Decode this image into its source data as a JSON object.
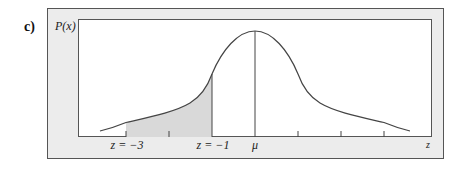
{
  "part_label": "c)",
  "figure": {
    "y_axis_label": "P(x)",
    "x_axis_label": "z",
    "tick_labels": [
      {
        "text": "z = −3",
        "x": 127
      },
      {
        "text": "z = −1",
        "x": 213
      },
      {
        "text": "μ",
        "x": 255
      }
    ],
    "shaded_region": {
      "from": "z = −3",
      "to": "z = −1"
    },
    "colors": {
      "frame_fill": "#ececec",
      "plot_fill": "#ffffff",
      "shade": "#d9d9d9",
      "line": "#444444"
    }
  }
}
